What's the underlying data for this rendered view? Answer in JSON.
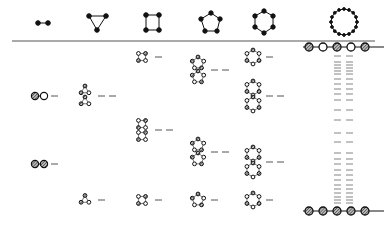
{
  "diagram": {
    "type": "ring-graph energy level diagram",
    "columns": [
      {
        "id": "n2",
        "label": "2-ring",
        "nodes": 2,
        "x": 48
      },
      {
        "id": "n3",
        "label": "3-ring",
        "nodes": 3,
        "x": 97
      },
      {
        "id": "n4",
        "label": "4-ring",
        "nodes": 4,
        "x": 154
      },
      {
        "id": "n5",
        "label": "5-ring",
        "nodes": 5,
        "x": 210
      },
      {
        "id": "n6",
        "label": "6-ring",
        "nodes": 6,
        "x": 265
      },
      {
        "id": "nN",
        "label": "large ring",
        "nodes": 16,
        "x": 343
      }
    ],
    "colors": {
      "line": "#444444",
      "node_fill": "#111111",
      "hatched_fill": "#999999",
      "background": "#ffffff"
    },
    "separator_y": 41,
    "top_chain": {
      "nodes": [
        "hatched",
        "open",
        "hatched",
        "open",
        "hatched"
      ],
      "y": 47
    },
    "bottom_chain": {
      "nodes": [
        "hatched",
        "hatched",
        "hatched",
        "hatched",
        "hatched"
      ],
      "y": 211
    },
    "levels": [
      {
        "column": "n2",
        "y": 96,
        "degeneracy": 1,
        "pattern": "hatched-open"
      },
      {
        "column": "n2",
        "y": 164,
        "degeneracy": 1,
        "pattern": "hatched-hatched"
      },
      {
        "column": "n3",
        "y": 96,
        "degeneracy": 2,
        "pattern": "triangle pair"
      },
      {
        "column": "n3",
        "y": 200,
        "degeneracy": 1,
        "pattern": "triangle"
      },
      {
        "column": "n4",
        "y": 57,
        "degeneracy": 1,
        "pattern": "square"
      },
      {
        "column": "n4",
        "y": 130,
        "degeneracy": 2,
        "pattern": "square pair"
      },
      {
        "column": "n4",
        "y": 200,
        "degeneracy": 1,
        "pattern": "square"
      },
      {
        "column": "n5",
        "y": 70,
        "degeneracy": 2,
        "pattern": "pentagon pair"
      },
      {
        "column": "n5",
        "y": 152,
        "degeneracy": 2,
        "pattern": "pentagon pair"
      },
      {
        "column": "n5",
        "y": 200,
        "degeneracy": 1,
        "pattern": "pentagon"
      },
      {
        "column": "n6",
        "y": 57,
        "degeneracy": 1,
        "pattern": "hexagon"
      },
      {
        "column": "n6",
        "y": 96,
        "degeneracy": 2,
        "pattern": "hexagon pair"
      },
      {
        "column": "n6",
        "y": 162,
        "degeneracy": 2,
        "pattern": "hexagon pair"
      },
      {
        "column": "n6",
        "y": 200,
        "degeneracy": 1,
        "pattern": "hexagon"
      }
    ],
    "large_ring_levels_y": [
      56,
      62,
      65,
      68,
      71,
      74,
      79,
      84,
      89,
      94,
      100,
      110,
      120,
      133,
      142,
      153,
      159,
      164,
      170,
      175,
      180,
      185,
      189,
      193,
      197,
      200,
      203
    ]
  }
}
